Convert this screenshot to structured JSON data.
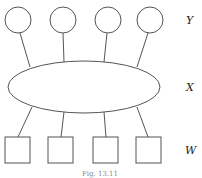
{
  "diagram": {
    "layers": [
      {
        "label": "Y",
        "shape": "circle",
        "count": 4
      },
      {
        "label": "X",
        "shape": "ellipse",
        "count": 1
      },
      {
        "label": "W",
        "shape": "square",
        "count": 4
      }
    ],
    "caption": "Fig. 13.11"
  }
}
